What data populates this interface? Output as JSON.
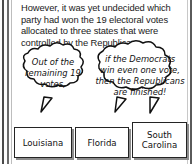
{
  "panel": {
    "narration": {
      "lines": [
        "However, it was yet undecided which",
        "party had won the 19 electoral votes",
        "allocated to three states that were",
        "controlled by the Republicans."
      ]
    },
    "speech_bubbles": [
      {
        "id": "bubble-left",
        "lines": [
          "Out of the",
          "remaining 19",
          "votes,"
        ]
      },
      {
        "id": "bubble-right",
        "lines": [
          "if the Democrats",
          "win even one vote,",
          "then the Republicans",
          "are finished!"
        ]
      }
    ],
    "state_boxes": [
      {
        "lines": [
          "Louisiana"
        ]
      },
      {
        "lines": [
          "Florida"
        ]
      },
      {
        "lines": [
          "South",
          "Carolina"
        ]
      }
    ],
    "colors": {
      "ink": "#111111",
      "paper": "#ffffff",
      "gutter_line": "#4a4a4a",
      "box_shadow": "#8d8d8d"
    }
  }
}
